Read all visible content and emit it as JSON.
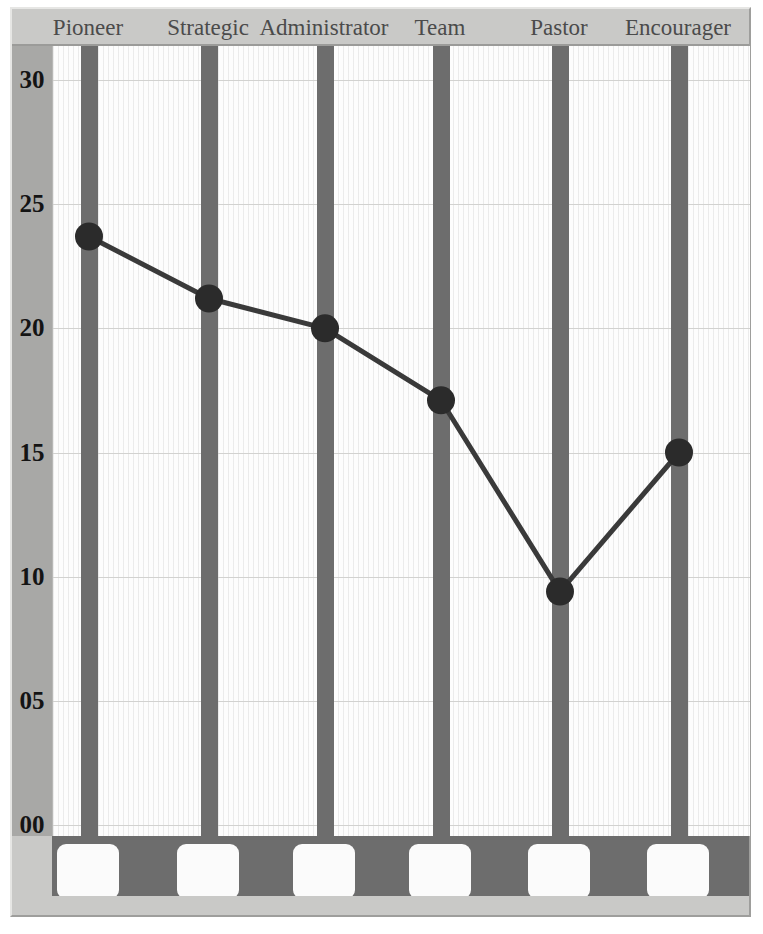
{
  "chart_data": {
    "type": "line",
    "title": "",
    "subtitle": "",
    "xlabel": "",
    "ylabel": "",
    "categories": [
      "Pioneer",
      "Strategic",
      "Administrator",
      "Team",
      "Pastor",
      "Encourager"
    ],
    "values": [
      23.7,
      21.2,
      20.0,
      17.1,
      9.4,
      15.0
    ],
    "series": [
      {
        "name": "Score",
        "values": [
          23.7,
          21.2,
          20.0,
          17.1,
          9.4,
          15.0
        ]
      }
    ],
    "ylim": [
      0,
      32
    ],
    "ytick_labels": [
      "30",
      "25",
      "20",
      "15",
      "10",
      "05",
      "00"
    ],
    "ytick_values": [
      30,
      25,
      20,
      15,
      10,
      5,
      0
    ],
    "grid": true,
    "legend_position": "none",
    "marker": "filled-circle",
    "line_color": "#3a3a3a",
    "marker_color": "#2b2b2b",
    "category_bar_color": "#6d6d6d",
    "plot_background": "#fdfdfd",
    "frame_color": "#c9c9c7",
    "axis_gutter_color": "#a8a8a6",
    "gridline_color": "#d2d2d0"
  },
  "header": {
    "categories": [
      "Pioneer",
      "Strategic",
      "Administrator",
      "Team",
      "Pastor",
      "Encourager"
    ]
  },
  "axis": {
    "y_ticks": [
      "30",
      "25",
      "20",
      "15",
      "10",
      "05",
      "00"
    ]
  },
  "footer": {
    "swatches": [
      "",
      "",
      "",
      "",
      "",
      ""
    ]
  }
}
